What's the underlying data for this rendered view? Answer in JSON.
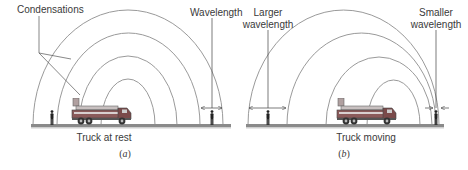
{
  "figure": {
    "panel_a": {
      "caption_letter": "a",
      "caption": "(a)",
      "ground_label": "Truck at rest",
      "labels": {
        "condensations": "Condensations",
        "wavelength": "Wavelength"
      }
    },
    "panel_b": {
      "caption_letter": "b",
      "caption": "(b)",
      "ground_label": "Truck moving",
      "labels": {
        "larger_line1": "Larger",
        "larger_line2": "wavelength",
        "smaller_line1": "Smaller",
        "smaller_line2": "wavelength"
      }
    },
    "colors": {
      "wavefront": "#9a9a9a",
      "leader": "#555555",
      "ground": "#7a7a7a",
      "truck_body": "#8a5a5a",
      "person": "#222222"
    }
  }
}
